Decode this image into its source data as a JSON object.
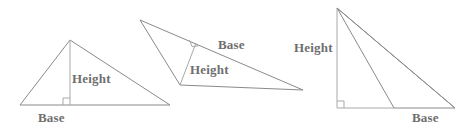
{
  "figure": {
    "stroke_color": "#8a8a8a",
    "label_color": "#6f6f6f",
    "background_color": "#ffffff",
    "width": 473,
    "height": 135,
    "label_text": {
      "base": "Base",
      "height": "Height"
    },
    "triangles": [
      {
        "id": "triangle-1",
        "kind": "acute-triangle",
        "vertices": [
          [
            20,
            105
          ],
          [
            70,
            40
          ],
          [
            170,
            105
          ]
        ],
        "base_segment": [
          [
            20,
            105
          ],
          [
            170,
            105
          ]
        ],
        "height_segment": [
          [
            70,
            40
          ],
          [
            70,
            105
          ]
        ],
        "right_angle_marker": {
          "x": 70,
          "y": 105,
          "size": 7,
          "orientation": "up-left"
        },
        "base_label": "Base",
        "height_label": "Height"
      },
      {
        "id": "triangle-2",
        "kind": "oblique-triangle",
        "vertices": [
          [
            140,
            20
          ],
          [
            303,
            90
          ],
          [
            180,
            85
          ]
        ],
        "base_segment": [
          [
            140,
            20
          ],
          [
            303,
            90
          ]
        ],
        "height_segment": [
          [
            180,
            85
          ],
          [
            196,
            43
          ]
        ],
        "right_angle_marker": {
          "x": 196,
          "y": 43,
          "size": 7,
          "orientation": "rotated"
        },
        "base_label": "Base",
        "height_label": "Height"
      },
      {
        "id": "triangle-3",
        "kind": "obtuse-triangle",
        "vertices": [
          [
            337,
            8
          ],
          [
            394,
            108
          ],
          [
            455,
            108
          ]
        ],
        "base_segment": [
          [
            394,
            108
          ],
          [
            455,
            108
          ]
        ],
        "height_segment": [
          [
            337,
            8
          ],
          [
            337,
            108
          ]
        ],
        "base_extension": [
          [
            337,
            108
          ],
          [
            394,
            108
          ]
        ],
        "right_angle_marker": {
          "x": 337,
          "y": 108,
          "size": 7,
          "orientation": "up-right"
        },
        "base_label": "Base",
        "height_label": "Height"
      }
    ]
  }
}
